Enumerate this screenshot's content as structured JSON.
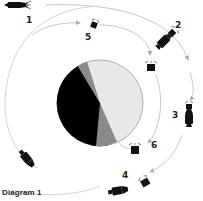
{
  "caption": "Diagram 1",
  "colors": {
    "orbit": "#c8c8c8",
    "arrow": "#aaaaaa",
    "moon_light": "#e8e8e8",
    "moon_mid": "#8a8a8a",
    "moon_dark": "#000000",
    "moon_outline": "#9a9a9a",
    "spacecraft": "#111111",
    "label": "#222222"
  },
  "moon": {
    "cx": 100,
    "cy": 103,
    "r": 43
  },
  "positions": [
    {
      "id": "1",
      "label": "1"
    },
    {
      "id": "2",
      "label": "2"
    },
    {
      "id": "3",
      "label": "3"
    },
    {
      "id": "4",
      "label": "4"
    },
    {
      "id": "5",
      "label": "5"
    },
    {
      "id": "6",
      "label": "6"
    }
  ]
}
